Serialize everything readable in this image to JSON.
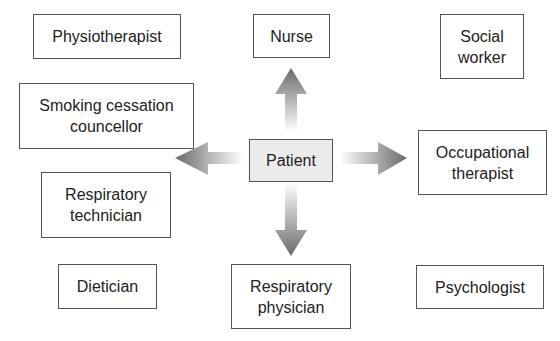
{
  "diagram": {
    "center": {
      "label": "Patient"
    },
    "nodes": [
      {
        "id": "physiotherapist",
        "label": "Physiotherapist"
      },
      {
        "id": "nurse",
        "label": "Nurse"
      },
      {
        "id": "social-worker",
        "label": "Social\nworker"
      },
      {
        "id": "smoking-cessation-councellor",
        "label": "Smoking cessation\ncouncellor"
      },
      {
        "id": "occupational-therapist",
        "label": "Occupational\ntherapist"
      },
      {
        "id": "respiratory-technician",
        "label": "Respiratory\ntechnician"
      },
      {
        "id": "dietician",
        "label": "Dietician"
      },
      {
        "id": "respiratory-physician",
        "label": "Respiratory\nphysician"
      },
      {
        "id": "psychologist",
        "label": "Psychologist"
      }
    ],
    "arrows": [
      "up",
      "down",
      "left",
      "right"
    ],
    "colors": {
      "box_border": "#555555",
      "center_fill": "#ebebeb",
      "arrow_dark": "#666666"
    }
  }
}
